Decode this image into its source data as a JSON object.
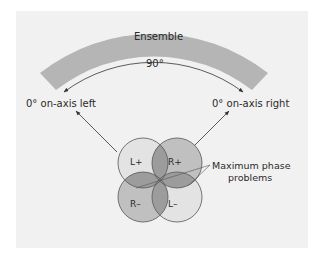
{
  "diagram": {
    "arc_label": "Ensemble",
    "angle_label": "90°",
    "left_label": "0° on-axis left",
    "right_label": "0° on-axis right",
    "circles": [
      {
        "id": "L+",
        "label": "L+"
      },
      {
        "id": "R+",
        "label": "R+"
      },
      {
        "id": "R-",
        "label": "R–"
      },
      {
        "id": "L-",
        "label": "L–"
      }
    ],
    "callout_line1": "Maximum phase",
    "callout_line2": "problems",
    "colors": {
      "background": "#f1f1f1",
      "ensemble_band": "#b5b5b5",
      "circle_light": "#e3e3e3",
      "circle_mid": "#c0c0c0",
      "overlap": "#9c9c9c",
      "stroke": "#555555"
    }
  }
}
